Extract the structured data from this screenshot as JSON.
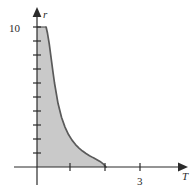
{
  "figure": {
    "kind": "shaded-region-plot",
    "background_color": "#ffffff"
  },
  "axes": {
    "x": {
      "label": "T",
      "label_style": "italic",
      "arrow": "right",
      "tick_labels": [
        "3"
      ],
      "ticks": [
        1,
        2,
        3
      ],
      "color": "#2b2b2b"
    },
    "y": {
      "label": "r",
      "label_style": "italic",
      "arrow": "up",
      "tick_labels": [
        "10"
      ],
      "ticks": [
        1,
        2,
        3,
        4,
        5,
        6,
        7,
        8,
        9,
        10
      ],
      "color": "#2b2b2b"
    }
  },
  "region": {
    "fill_color": "#c9c9c9",
    "curve_color": "#5a5a5a"
  },
  "chart_data": {
    "type": "area",
    "title": "",
    "xlabel": "T",
    "ylabel": "r",
    "xlim": [
      0,
      3.85
    ],
    "ylim": [
      0,
      11.3
    ],
    "grid": false,
    "legend": null,
    "xticks": [
      1,
      2,
      3
    ],
    "xticklabels": [
      "",
      "",
      "3"
    ],
    "yticks": [
      1,
      2,
      3,
      4,
      5,
      6,
      7,
      8,
      9,
      10
    ],
    "yticklabels": [
      "",
      "",
      "",
      "",
      "",
      "",
      "",
      "",
      "",
      "10"
    ],
    "series": [
      {
        "name": "shaded region boundary",
        "fill": true,
        "x": [
          0.26,
          0.3,
          0.35,
          0.4,
          0.45,
          0.5,
          0.6,
          0.7,
          0.8,
          0.9,
          1.0,
          1.1,
          1.2,
          1.3,
          1.4,
          1.5,
          1.6,
          1.7,
          1.8,
          1.9,
          1.97
        ],
        "y": [
          10.0,
          9.55,
          8.8,
          7.85,
          6.9,
          6.0,
          4.55,
          3.55,
          2.85,
          2.32,
          1.92,
          1.6,
          1.35,
          1.14,
          0.96,
          0.81,
          0.67,
          0.54,
          0.4,
          0.2,
          0.0
        ]
      }
    ],
    "annotations": []
  }
}
